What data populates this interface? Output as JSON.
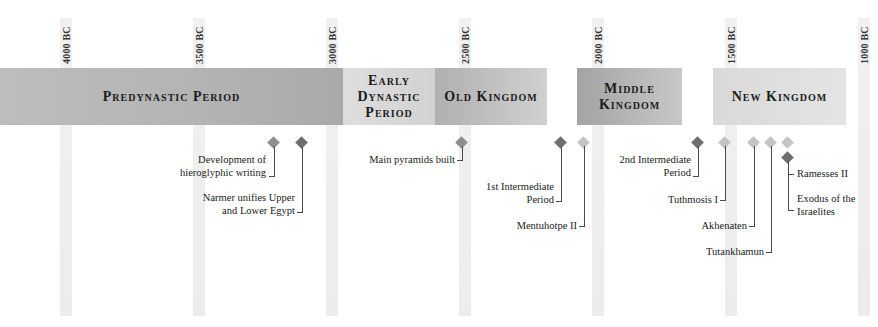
{
  "timeline": {
    "axis": {
      "ticks": [
        {
          "label": "4000 BC",
          "x": 66
        },
        {
          "label": "3500 BC",
          "x": 199
        },
        {
          "label": "3000 BC",
          "x": 332
        },
        {
          "label": "2500 BC",
          "x": 465
        },
        {
          "label": "2000 BC",
          "x": 598
        },
        {
          "label": "1500 BC",
          "x": 731
        },
        {
          "label": "1000 BC",
          "x": 864
        }
      ]
    },
    "periods": [
      {
        "label": "Predynastic Period"
      },
      {
        "label_lines": [
          "Early",
          "Dynastic",
          "Period"
        ]
      },
      {
        "label": "Old Kingdom"
      },
      {
        "label_lines": [
          "Middle",
          "Kingdom"
        ]
      },
      {
        "label": "New Kingdom"
      }
    ],
    "events": [
      {
        "lines": [
          "Development of",
          "hieroglyphic writing"
        ],
        "tone": "mid"
      },
      {
        "lines": [
          "Narmer unifies Upper",
          "and Lower Egypt"
        ],
        "tone": "dark"
      },
      {
        "lines": [
          "Main pyramids built"
        ],
        "tone": "mid"
      },
      {
        "lines": [
          "1st Intermediate",
          "Period"
        ],
        "tone": "dark"
      },
      {
        "lines": [
          "Mentuhotpe II"
        ],
        "tone": "light"
      },
      {
        "lines": [
          "2nd Intermediate",
          "Period"
        ],
        "tone": "dark"
      },
      {
        "lines": [
          "Tuthmosis I"
        ],
        "tone": "light"
      },
      {
        "lines": [
          "Akhenaten"
        ],
        "tone": "light"
      },
      {
        "lines": [
          "Tutankhamun"
        ],
        "tone": "light"
      },
      {
        "lines": [
          "Ramesses II"
        ],
        "tone": "light"
      },
      {
        "lines": [
          "Exodus of the",
          "Israelites"
        ],
        "tone": "dark"
      }
    ],
    "colors": {
      "marker_dark": "#6e6e6e",
      "marker_mid": "#8f8f8f",
      "marker_light": "#c4c4c4",
      "grid": "#efefef"
    }
  }
}
